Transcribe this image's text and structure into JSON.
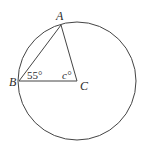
{
  "diagram": {
    "type": "circle-geometry",
    "circle": {
      "cx": 77,
      "cy": 81,
      "r": 59,
      "stroke": "#444444"
    },
    "points": {
      "A": {
        "label": "A",
        "x": 61,
        "y": 25
      },
      "B": {
        "label": "B",
        "x": 19,
        "y": 81
      },
      "C": {
        "label": "C",
        "x": 77,
        "y": 81
      }
    },
    "segments": [
      {
        "from": "A",
        "to": "B"
      },
      {
        "from": "B",
        "to": "C"
      },
      {
        "from": "C",
        "to": "A"
      }
    ],
    "angles": {
      "B": {
        "label": "55°",
        "value": 55
      },
      "C": {
        "label": "c°",
        "value": "c"
      }
    },
    "line_color": "#444444",
    "text_color": "#2a2a2a"
  }
}
